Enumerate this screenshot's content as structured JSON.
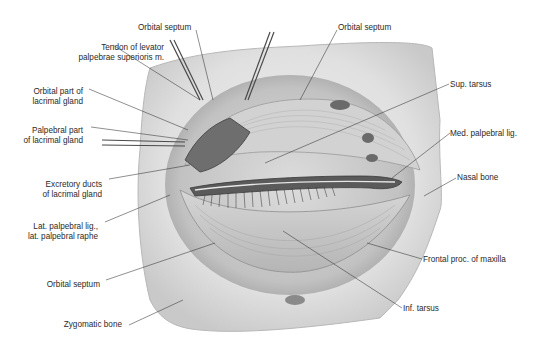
{
  "figure": {
    "colors": {
      "bone": "#e4e4e4",
      "bone_shadow": "#bdbdbd",
      "muscle": "#cfcfcf",
      "line": "#333333",
      "text": "#2a2a2a",
      "background": "#ffffff"
    }
  },
  "labels": {
    "left": [
      {
        "id": "tendon_levator",
        "line1": "Tendon of levator",
        "line2": "palpebrae superioris m."
      },
      {
        "id": "orbital_part_lacrimal",
        "line1": "Orbital part of",
        "line2": "lacrimal gland"
      },
      {
        "id": "palpebral_part_lacrimal",
        "line1": "Palpebral part",
        "line2": "of lacrimal gland"
      },
      {
        "id": "excretory_ducts",
        "line1": "Excretory ducts",
        "line2": "of lacrimal gland"
      },
      {
        "id": "lat_palpebral_lig",
        "line1": "Lat. palpebral lig.,",
        "line2": "lat. palpebral raphe"
      },
      {
        "id": "orbital_septum_lower",
        "line1": "Orbital septum"
      },
      {
        "id": "zygomatic_bone",
        "line1": "Zygomatic bone"
      }
    ],
    "top": [
      {
        "id": "orbital_septum_top_left",
        "line1": "Orbital septum"
      },
      {
        "id": "orbital_septum_top_right",
        "line1": "Orbital septum"
      }
    ],
    "right": [
      {
        "id": "sup_tarsus",
        "line1": "Sup. tarsus"
      },
      {
        "id": "med_palpebral_lig",
        "line1": "Med. palpebral lig."
      },
      {
        "id": "nasal_bone",
        "line1": "Nasal bone"
      },
      {
        "id": "frontal_proc_maxilla",
        "line1": "Frontal proc. of maxilla"
      },
      {
        "id": "inf_tarsus",
        "line1": "Inf. tarsus"
      }
    ]
  }
}
